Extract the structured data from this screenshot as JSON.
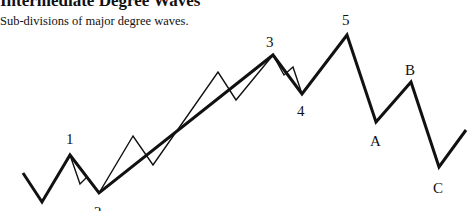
{
  "header": {
    "title": "Intermediate Degree Waves",
    "subtitle": "Sub-divisions of major degree waves."
  },
  "diagram": {
    "type": "elliott-wave",
    "colors": {
      "line": "#111111",
      "background": "#ffffff"
    },
    "major_wave_points": [
      [
        23,
        173
      ],
      [
        42,
        202
      ],
      [
        70,
        155
      ],
      [
        99,
        193
      ],
      [
        273,
        55
      ],
      [
        302,
        94
      ],
      [
        347,
        35
      ],
      [
        376,
        122
      ],
      [
        411,
        82
      ],
      [
        439,
        167
      ],
      [
        466,
        130
      ]
    ],
    "minor_wave_points": [
      [
        70,
        155
      ],
      [
        80,
        184
      ],
      [
        87,
        177
      ],
      [
        99,
        193
      ],
      [
        133,
        136
      ],
      [
        153,
        165
      ],
      [
        218,
        72
      ],
      [
        236,
        100
      ],
      [
        273,
        55
      ],
      [
        284,
        75
      ],
      [
        293,
        67
      ],
      [
        302,
        94
      ]
    ],
    "labels": [
      {
        "text": "1",
        "x": 66,
        "y": 144
      },
      {
        "text": "2",
        "x": 94,
        "y": 217
      },
      {
        "text": "3",
        "x": 266,
        "y": 47
      },
      {
        "text": "4",
        "x": 297,
        "y": 116
      },
      {
        "text": "5",
        "x": 342,
        "y": 25
      },
      {
        "text": "A",
        "x": 370,
        "y": 146
      },
      {
        "text": "B",
        "x": 405,
        "y": 75
      },
      {
        "text": "C",
        "x": 433,
        "y": 193
      }
    ]
  }
}
